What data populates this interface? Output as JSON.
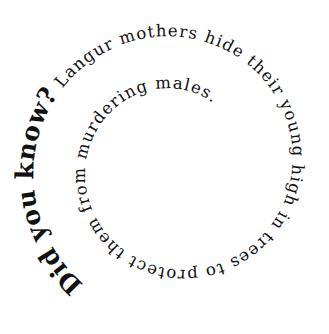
{
  "graphic": {
    "background": "#ffffff",
    "text_color": "#111111",
    "intro": "Did you know?",
    "fact": " Langur mothers hide their young high in trees to protect them from murdering males.",
    "full_text": "Did you know? Langur mothers hide their young high in trees to protect them from murdering males.",
    "layout": "clockwise spiral, outer start at bottom-left, winding inward"
  }
}
